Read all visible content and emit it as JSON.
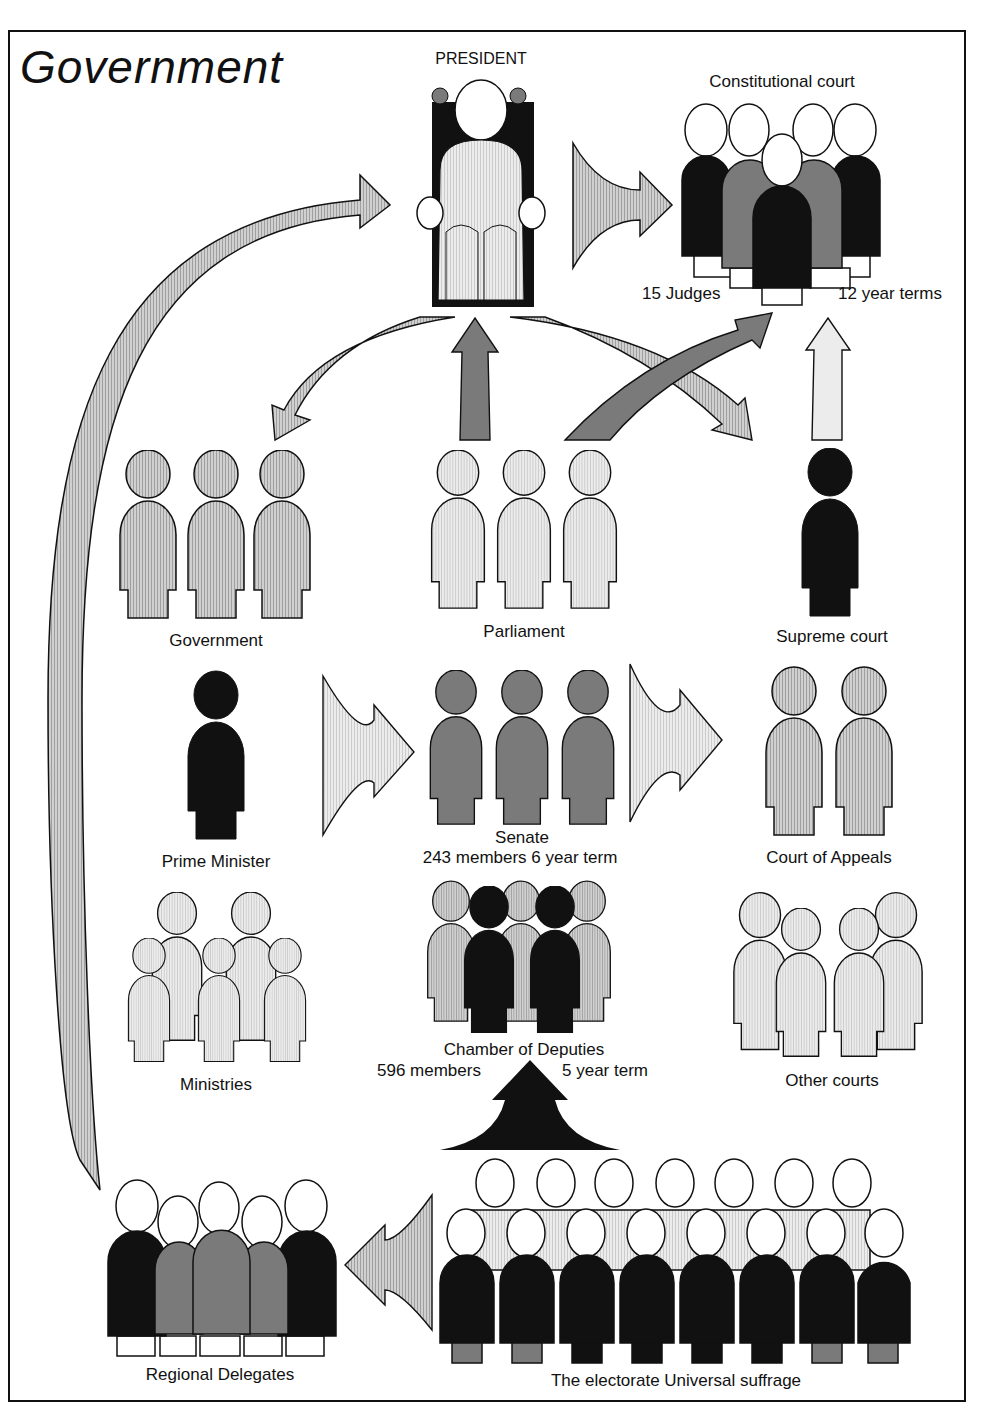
{
  "title": "Government",
  "nodes": {
    "president": {
      "label": "PRESIDENT"
    },
    "constitutional_court": {
      "label": "Constitutional court",
      "judges": "15 Judges",
      "terms": "12 year terms"
    },
    "government": {
      "label": "Government"
    },
    "parliament": {
      "label": "Parliament"
    },
    "supreme_court": {
      "label": "Supreme court"
    },
    "prime_minister": {
      "label": "Prime Minister"
    },
    "senate": {
      "label": "Senate",
      "detail": "243 members 6 year term"
    },
    "court_of_appeals": {
      "label": "Court of Appeals"
    },
    "ministries": {
      "label": "Ministries"
    },
    "chamber_of_deputies": {
      "label": "Chamber of Deputies",
      "members": "596 members",
      "term": "5 year term"
    },
    "other_courts": {
      "label": "Other courts"
    },
    "regional_delegates": {
      "label": "Regional Delegates"
    },
    "electorate": {
      "label": "The electorate Universal suffrage"
    }
  },
  "colors": {
    "black": "#111111",
    "dark_gray": "#7a7a7a",
    "light_gray": "#c9c9c9",
    "pale": "#e6e6e6",
    "white": "#ffffff"
  }
}
